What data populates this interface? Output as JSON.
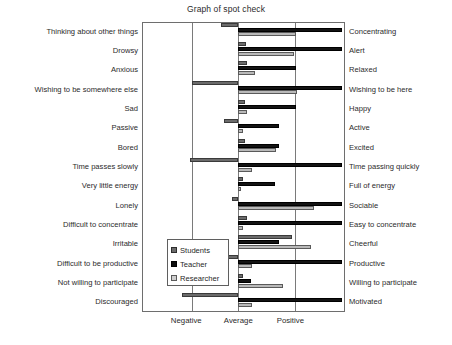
{
  "chart_data": {
    "type": "bar",
    "title": "Graph of spot check",
    "xlabel": "",
    "ylabel": "",
    "orientation": "horizontal",
    "grid": true,
    "legend_position": "center-left-inside",
    "xlim": [
      -1.85,
      2.05
    ],
    "baseline": 0,
    "xticks": [
      -1,
      0,
      1
    ],
    "xticklabels": [
      "Negative",
      "Average",
      "Positive"
    ],
    "categories_left": [
      "Thinking about other things",
      "Drowsy",
      "Anxious",
      "Wishing to be somewhere else",
      "Sad",
      "Passive",
      "Bored",
      "Time passes slowly",
      "Very little energy",
      "Lonely",
      "Difficult to concentrate",
      "Irritable",
      "Difficult to be productive",
      "Not willing to participate",
      "Discouraged"
    ],
    "categories_right": [
      "Concentrating",
      "Alert",
      "Relaxed",
      "Wishing to be here",
      "Happy",
      "Active",
      "Excited",
      "Time passing quickly",
      "Full of energy",
      "Sociable",
      "Easy to concentrate",
      "Cheerful",
      "Productive",
      "Willing to participate",
      "Motivated"
    ],
    "series": [
      {
        "name": "Students",
        "color": "#6b6b6b",
        "values": [
          -0.33,
          0.14,
          0.17,
          -0.88,
          0.13,
          -0.28,
          0.12,
          -0.92,
          0.1,
          -0.12,
          0.17,
          1.04,
          -0.6,
          0.1,
          -1.08
        ]
      },
      {
        "name": "Teacher",
        "color": "#131313",
        "values": [
          2.0,
          2.0,
          1.1,
          2.0,
          1.1,
          0.78,
          0.78,
          2.0,
          0.7,
          2.0,
          2.0,
          0.78,
          2.0,
          0.25,
          2.0
        ]
      },
      {
        "name": "Researcher",
        "color": "#b9b9b9",
        "values": [
          1.1,
          1.08,
          0.33,
          1.12,
          0.16,
          0.1,
          0.72,
          0.27,
          0.06,
          1.45,
          0.1,
          1.4,
          0.27,
          0.85,
          0.27
        ]
      }
    ]
  },
  "legend": {
    "items": [
      {
        "label": "Students"
      },
      {
        "label": "Teacher"
      },
      {
        "label": "Researcher"
      }
    ]
  }
}
